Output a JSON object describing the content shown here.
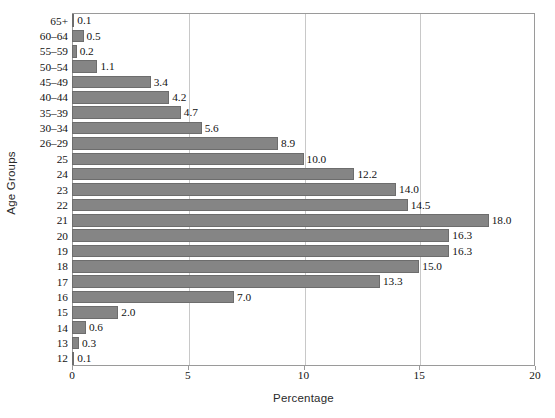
{
  "chart_data": {
    "type": "bar",
    "orientation": "horizontal",
    "title": "",
    "xlabel": "Percentage",
    "ylabel": "Age Groups",
    "xlim": [
      0,
      20
    ],
    "xticks": [
      "0",
      "5",
      "10",
      "15",
      "20"
    ],
    "xtick_values": [
      0,
      5,
      10,
      15,
      20
    ],
    "grid": "vertical",
    "legend": "none",
    "bar_color": "#858585",
    "categories": [
      "65+",
      "60–64",
      "55–59",
      "50–54",
      "45–49",
      "40–44",
      "35–39",
      "30–34",
      "26–29",
      "25",
      "24",
      "23",
      "22",
      "21",
      "20",
      "19",
      "18",
      "17",
      "16",
      "15",
      "14",
      "13",
      "12"
    ],
    "values": [
      0.1,
      0.5,
      0.2,
      1.1,
      3.4,
      4.2,
      4.7,
      5.6,
      8.9,
      10.0,
      12.2,
      14.0,
      14.5,
      18.0,
      16.3,
      16.3,
      15.0,
      13.3,
      7.0,
      2.0,
      0.6,
      0.3,
      0.1
    ],
    "value_labels": [
      "0.1",
      "0.5",
      "0.2",
      "1.1",
      "3.4",
      "4.2",
      "4.7",
      "5.6",
      "8.9",
      "10.0",
      "12.2",
      "14.0",
      "14.5",
      "18.0",
      "16.3",
      "16.3",
      "15.0",
      "13.3",
      "7.0",
      "2.0",
      "0.6",
      "0.3",
      "0.1"
    ]
  }
}
